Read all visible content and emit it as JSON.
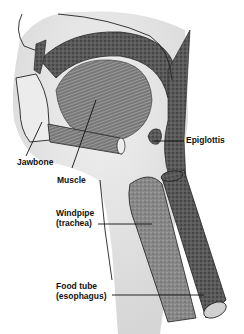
{
  "diagram": {
    "labels": {
      "jawbone": "Jawbone",
      "muscle": "Muscle",
      "epiglottis": "Epiglottis",
      "windpipe_line1": "Windpipe",
      "windpipe_line2": "(trachea)",
      "foodtube_line1": "Food tube",
      "foodtube_line2": "(esophagus)"
    },
    "colors": {
      "ink": "#111111",
      "stipple_dark": "#3a3a3a",
      "tissue_light": "#e6e6e6",
      "background": "#ffffff"
    }
  }
}
